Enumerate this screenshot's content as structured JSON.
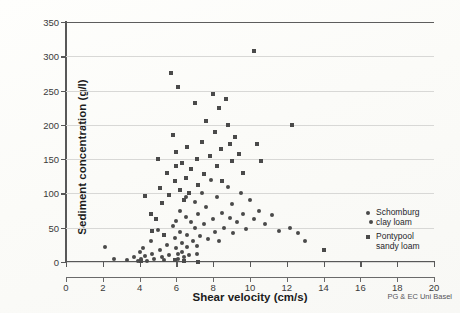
{
  "chart_data": {
    "type": "scatter",
    "title": "",
    "xlabel": "Shear velocity (cm/s)",
    "ylabel": "Sediment concentration (g/l)",
    "xlim": [
      0,
      20
    ],
    "ylim": [
      0,
      350
    ],
    "xticks": [
      0,
      2,
      4,
      6,
      8,
      10,
      12,
      14,
      16,
      18,
      20
    ],
    "yticks": [
      0,
      50,
      100,
      150,
      200,
      250,
      300,
      350
    ],
    "grid": "horizontal",
    "legend_position": "right-inside",
    "credit": "PG & EC Uni Basel",
    "series": [
      {
        "name": "Schomburg clay loam",
        "marker": "circle",
        "color": "#4a4a4a",
        "points": [
          [
            2.1,
            22
          ],
          [
            2.6,
            5
          ],
          [
            3.3,
            3
          ],
          [
            3.7,
            8
          ],
          [
            3.9,
            2
          ],
          [
            4.0,
            14
          ],
          [
            4.1,
            4
          ],
          [
            4.2,
            20
          ],
          [
            4.3,
            9
          ],
          [
            4.4,
            2
          ],
          [
            4.6,
            30
          ],
          [
            4.7,
            12
          ],
          [
            4.8,
            5
          ],
          [
            5.0,
            46
          ],
          [
            5.1,
            18
          ],
          [
            5.2,
            8
          ],
          [
            5.3,
            3
          ],
          [
            5.5,
            25
          ],
          [
            5.6,
            10
          ],
          [
            5.8,
            52
          ],
          [
            5.9,
            35
          ],
          [
            6.0,
            60
          ],
          [
            6.0,
            20
          ],
          [
            6.1,
            12
          ],
          [
            6.1,
            5
          ],
          [
            6.2,
            75
          ],
          [
            6.2,
            44
          ],
          [
            6.3,
            28
          ],
          [
            6.3,
            15
          ],
          [
            6.4,
            8
          ],
          [
            6.5,
            95
          ],
          [
            6.5,
            66
          ],
          [
            6.6,
            40
          ],
          [
            6.6,
            22
          ],
          [
            6.7,
            10
          ],
          [
            6.8,
            58
          ],
          [
            6.9,
            30
          ],
          [
            7.0,
            88
          ],
          [
            7.0,
            50
          ],
          [
            7.1,
            24
          ],
          [
            7.1,
            12
          ],
          [
            7.2,
            70
          ],
          [
            7.3,
            38
          ],
          [
            7.4,
            100
          ],
          [
            7.5,
            56
          ],
          [
            7.6,
            80
          ],
          [
            7.7,
            34
          ],
          [
            7.9,
            120
          ],
          [
            8.0,
            62
          ],
          [
            8.1,
            44
          ],
          [
            8.2,
            95
          ],
          [
            8.3,
            30
          ],
          [
            8.5,
            72
          ],
          [
            8.6,
            50
          ],
          [
            8.8,
            110
          ],
          [
            8.9,
            64
          ],
          [
            9.0,
            85
          ],
          [
            9.1,
            42
          ],
          [
            9.3,
            58
          ],
          [
            9.5,
            100
          ],
          [
            9.6,
            70
          ],
          [
            9.8,
            48
          ],
          [
            10.0,
            90
          ],
          [
            10.2,
            62
          ],
          [
            10.5,
            75
          ],
          [
            10.8,
            55
          ],
          [
            11.2,
            68
          ],
          [
            11.6,
            45
          ],
          [
            12.2,
            50
          ],
          [
            12.6,
            42
          ],
          [
            13.0,
            30
          ],
          [
            16.6,
            58
          ]
        ]
      },
      {
        "name": "Pontypool sandy loam",
        "marker": "square",
        "color": "#4a4a4a",
        "points": [
          [
            4.3,
            96
          ],
          [
            4.6,
            70
          ],
          [
            4.7,
            45
          ],
          [
            4.9,
            62
          ],
          [
            5.0,
            150
          ],
          [
            5.1,
            108
          ],
          [
            5.2,
            86
          ],
          [
            5.3,
            40
          ],
          [
            5.5,
            130
          ],
          [
            5.6,
            98
          ],
          [
            5.7,
            275
          ],
          [
            5.8,
            185
          ],
          [
            5.9,
            118
          ],
          [
            6.0,
            160
          ],
          [
            6.0,
            140
          ],
          [
            6.1,
            255
          ],
          [
            6.2,
            105
          ],
          [
            6.3,
            145
          ],
          [
            6.4,
            90
          ],
          [
            6.5,
            122
          ],
          [
            6.6,
            168
          ],
          [
            6.7,
            100
          ],
          [
            6.8,
            135
          ],
          [
            7.0,
            232
          ],
          [
            7.1,
            150
          ],
          [
            7.2,
            112
          ],
          [
            7.4,
            175
          ],
          [
            7.5,
            128
          ],
          [
            7.6,
            205
          ],
          [
            7.8,
            155
          ],
          [
            8.0,
            245
          ],
          [
            8.1,
            190
          ],
          [
            8.2,
            140
          ],
          [
            8.3,
            225
          ],
          [
            8.4,
            165
          ],
          [
            8.5,
            118
          ],
          [
            8.7,
            238
          ],
          [
            8.8,
            200
          ],
          [
            8.9,
            172
          ],
          [
            9.0,
            148
          ],
          [
            9.2,
            182
          ],
          [
            9.4,
            158
          ],
          [
            9.6,
            130
          ],
          [
            10.2,
            307
          ],
          [
            10.4,
            172
          ],
          [
            10.6,
            148
          ],
          [
            12.3,
            200
          ],
          [
            7.2,
            0
          ],
          [
            6.4,
            2
          ],
          [
            5.9,
            3
          ],
          [
            4.1,
            1
          ],
          [
            14.0,
            18
          ]
        ]
      }
    ]
  },
  "legend": {
    "items": [
      {
        "label": "Schomburg\nclay loam",
        "marker": "circle"
      },
      {
        "label": "Pontypool\nsandy loam",
        "marker": "square"
      }
    ]
  },
  "axes": {
    "x_title": "Shear velocity (cm/s)",
    "y_title": "Sediment concentration (g/l)",
    "x_tick_labels": [
      "0",
      "2",
      "4",
      "6",
      "8",
      "10",
      "12",
      "14",
      "16",
      "18",
      "20"
    ],
    "y_tick_labels": [
      "0",
      "50",
      "100",
      "150",
      "200",
      "250",
      "300",
      "350"
    ]
  },
  "credit": {
    "text": "PG & EC Uni Basel"
  },
  "colors": {
    "marker": "#4a4a4a",
    "axis": "#585858",
    "grid": "#d8d8d6",
    "background": "#fdfdfb"
  }
}
